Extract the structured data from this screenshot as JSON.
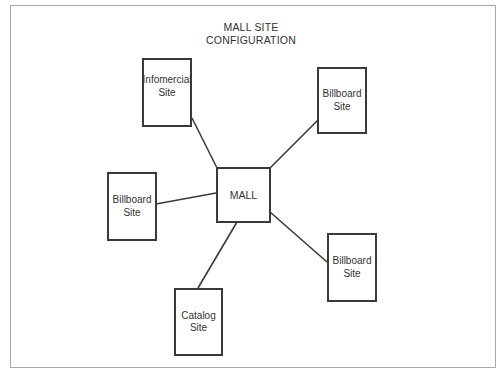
{
  "title": {
    "line1": "MALL SITE",
    "line2": "CONFIGURATION"
  },
  "center": {
    "label": "MALL"
  },
  "nodes": [
    {
      "id": "infomercial",
      "label": "Infomercial\nSite"
    },
    {
      "id": "billboard-top-right",
      "label": "Billboard\nSite"
    },
    {
      "id": "billboard-left",
      "label": "Billboard\nSite"
    },
    {
      "id": "billboard-bottom-right",
      "label": "Billboard\nSite"
    },
    {
      "id": "catalog",
      "label": "Catalog\nSite"
    }
  ],
  "colors": {
    "stroke": "#3a3a3a",
    "frame": "#a8a8a8",
    "text": "#333333"
  }
}
